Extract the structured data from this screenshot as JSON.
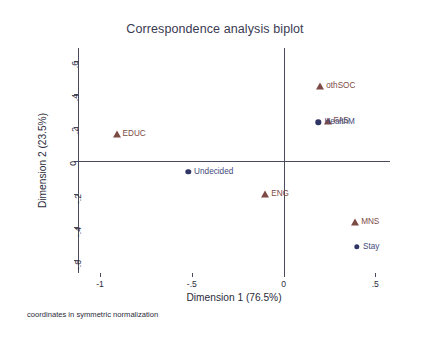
{
  "chart_data": {
    "type": "scatter",
    "title": "Correspondence analysis biplot",
    "xlabel": "Dimension 1 (76.5%)",
    "ylabel": "Dimension 2 (23.5%)",
    "footnote": "coordinates in symmetric normalization",
    "xlim": [
      -1.12,
      0.58
    ],
    "ylim": [
      -0.68,
      0.68
    ],
    "grid": false,
    "legend": "none",
    "xticks": [
      {
        "value": -1,
        "label": "-1"
      },
      {
        "value": -0.5,
        "label": "-.5"
      },
      {
        "value": 0,
        "label": "0"
      },
      {
        "value": 0.5,
        "label": ".5"
      }
    ],
    "yticks": [
      {
        "value": 0.6,
        "label": ".6"
      },
      {
        "value": 0.4,
        "label": ".4"
      },
      {
        "value": 0.2,
        "label": ".2"
      },
      {
        "value": 0,
        "label": "0"
      },
      {
        "value": -0.2,
        "label": "-.2"
      },
      {
        "value": -0.4,
        "label": "-.4"
      },
      {
        "value": -0.6,
        "label": "-.6"
      }
    ],
    "reference_lines": {
      "x": 0,
      "y": 0
    },
    "series": [
      {
        "name": "dimension-2-column-points",
        "marker": "triangle",
        "color": "#7d4b46",
        "points": [
          {
            "label": "othSOC",
            "x": 0.2,
            "y": 0.45
          },
          {
            "label": "FAS",
            "x": 0.24,
            "y": 0.24
          },
          {
            "label": "EDUC",
            "x": -0.91,
            "y": 0.16
          },
          {
            "label": "ENG",
            "x": -0.1,
            "y": -0.2
          },
          {
            "label": "MNS",
            "x": 0.39,
            "y": -0.37
          }
        ]
      },
      {
        "name": "dimension-2-row-points",
        "marker": "dot",
        "color": "#2f3564",
        "points": [
          {
            "label": "HealthM",
            "x": 0.19,
            "y": 0.23
          },
          {
            "label": "Undecided",
            "x": -0.52,
            "y": -0.07
          },
          {
            "label": "Stay",
            "x": 0.4,
            "y": -0.52
          }
        ]
      }
    ]
  }
}
